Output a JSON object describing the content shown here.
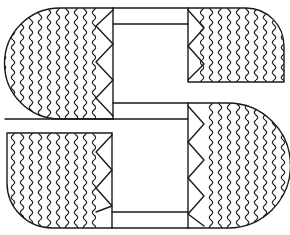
{
  "figure": {
    "type": "line-art",
    "colors": {
      "background": "#ffffff",
      "line": "#1a1a1a"
    },
    "pattern": {
      "fill_style": "ogee-waves",
      "border_style": "zigzag-triangles"
    }
  }
}
